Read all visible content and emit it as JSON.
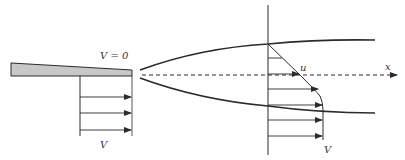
{
  "figure": {
    "type": "boundary-layer / wake diagram",
    "colors": {
      "line": "#2b2b2b",
      "plate_fill": "#c8c8c8",
      "background": "#ffffff"
    },
    "labels": {
      "plate_wall_velocity": "V = 0",
      "upstream_velocity": "V",
      "wake_velocity_local": "u",
      "wake_freestream_velocity": "V",
      "axis": "x"
    }
  }
}
